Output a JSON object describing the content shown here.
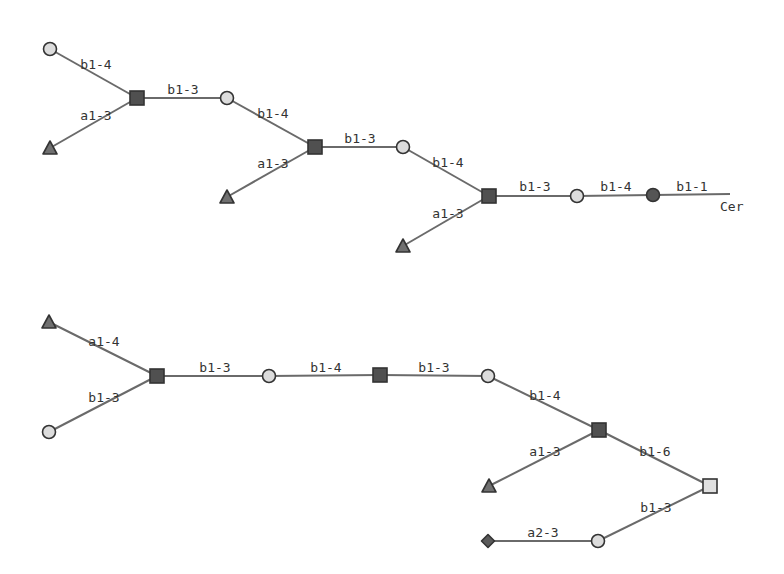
{
  "colors": {
    "background": "#ffffff",
    "edge": "#6a6a6a",
    "label": "#333333",
    "gal_fill": "#dcdcdc",
    "glc_fill": "#555555",
    "glcnac_fill": "#505050",
    "galnac_fill": "#e0e0e0",
    "fuc_fill": "#707070",
    "neuac_fill": "#5a5a5a",
    "stroke": "#333333"
  },
  "diagrams": [
    {
      "id": "top",
      "nodes": [
        {
          "id": "t1",
          "type": "Gal",
          "shape": "circle",
          "fill": "gal_fill",
          "x": 50,
          "y": 49
        },
        {
          "id": "t2",
          "type": "Fuc",
          "shape": "triangle",
          "fill": "fuc_fill",
          "x": 50,
          "y": 148
        },
        {
          "id": "t3",
          "type": "GlcNAc",
          "shape": "square",
          "fill": "glcnac_fill",
          "x": 137,
          "y": 98
        },
        {
          "id": "t4",
          "type": "Gal",
          "shape": "circle",
          "fill": "gal_fill",
          "x": 227,
          "y": 98
        },
        {
          "id": "t5",
          "type": "Fuc",
          "shape": "triangle",
          "fill": "fuc_fill",
          "x": 227,
          "y": 197
        },
        {
          "id": "t6",
          "type": "GlcNAc",
          "shape": "square",
          "fill": "glcnac_fill",
          "x": 315,
          "y": 147
        },
        {
          "id": "t7",
          "type": "Gal",
          "shape": "circle",
          "fill": "gal_fill",
          "x": 403,
          "y": 147
        },
        {
          "id": "t8",
          "type": "Fuc",
          "shape": "triangle",
          "fill": "fuc_fill",
          "x": 403,
          "y": 246
        },
        {
          "id": "t9",
          "type": "GlcNAc",
          "shape": "square",
          "fill": "glcnac_fill",
          "x": 489,
          "y": 196
        },
        {
          "id": "t10",
          "type": "Gal",
          "shape": "circle",
          "fill": "gal_fill",
          "x": 577,
          "y": 196
        },
        {
          "id": "t11",
          "type": "Glc",
          "shape": "circle",
          "fill": "glc_fill",
          "x": 653,
          "y": 195
        }
      ],
      "edges": [
        {
          "from": "t1",
          "to": "t3",
          "label": "b1-4",
          "lx": 96,
          "ly": 69
        },
        {
          "from": "t2",
          "to": "t3",
          "label": "a1-3",
          "lx": 96,
          "ly": 120
        },
        {
          "from": "t3",
          "to": "t4",
          "label": "b1-3",
          "lx": 183,
          "ly": 94
        },
        {
          "from": "t4",
          "to": "t6",
          "label": "b1-4",
          "lx": 273,
          "ly": 118
        },
        {
          "from": "t5",
          "to": "t6",
          "label": "a1-3",
          "lx": 273,
          "ly": 168
        },
        {
          "from": "t6",
          "to": "t7",
          "label": "b1-3",
          "lx": 360,
          "ly": 143
        },
        {
          "from": "t7",
          "to": "t9",
          "label": "b1-4",
          "lx": 448,
          "ly": 167
        },
        {
          "from": "t8",
          "to": "t9",
          "label": "a1-3",
          "lx": 448,
          "ly": 218
        },
        {
          "from": "t9",
          "to": "t10",
          "label": "b1-3",
          "lx": 535,
          "ly": 191
        },
        {
          "from": "t10",
          "to": "t11",
          "label": "b1-4",
          "lx": 616,
          "ly": 191
        },
        {
          "from": "t11",
          "to": "aglycone",
          "label": "b1-1",
          "lx": 692,
          "ly": 191
        }
      ],
      "aglycone": {
        "label": "Cer",
        "x": 730,
        "y": 194,
        "lx": 720,
        "ly": 211
      }
    },
    {
      "id": "bottom",
      "nodes": [
        {
          "id": "b1",
          "type": "Fuc",
          "shape": "triangle",
          "fill": "fuc_fill",
          "x": 49,
          "y": 322
        },
        {
          "id": "b2",
          "type": "Gal",
          "shape": "circle",
          "fill": "gal_fill",
          "x": 49,
          "y": 432
        },
        {
          "id": "b3",
          "type": "GlcNAc",
          "shape": "square",
          "fill": "glcnac_fill",
          "x": 157,
          "y": 376
        },
        {
          "id": "b4",
          "type": "Gal",
          "shape": "circle",
          "fill": "gal_fill",
          "x": 269,
          "y": 376
        },
        {
          "id": "b5",
          "type": "GlcNAc",
          "shape": "square",
          "fill": "glcnac_fill",
          "x": 380,
          "y": 375
        },
        {
          "id": "b6",
          "type": "Gal",
          "shape": "circle",
          "fill": "gal_fill",
          "x": 488,
          "y": 376
        },
        {
          "id": "b7",
          "type": "GlcNAc",
          "shape": "square",
          "fill": "glcnac_fill",
          "x": 599,
          "y": 430
        },
        {
          "id": "b8",
          "type": "Fuc",
          "shape": "triangle",
          "fill": "fuc_fill",
          "x": 489,
          "y": 486
        },
        {
          "id": "b9",
          "type": "GalNAc",
          "shape": "square",
          "fill": "galnac_fill",
          "x": 710,
          "y": 486
        },
        {
          "id": "b10",
          "type": "Gal",
          "shape": "circle",
          "fill": "gal_fill",
          "x": 598,
          "y": 541
        },
        {
          "id": "b11",
          "type": "NeuAc",
          "shape": "diamond",
          "fill": "neuac_fill",
          "x": 488,
          "y": 541
        }
      ],
      "edges": [
        {
          "from": "b1",
          "to": "b3",
          "label": "a1-4",
          "lx": 104,
          "ly": 346
        },
        {
          "from": "b2",
          "to": "b3",
          "label": "b1-3",
          "lx": 104,
          "ly": 402
        },
        {
          "from": "b3",
          "to": "b4",
          "label": "b1-3",
          "lx": 215,
          "ly": 372
        },
        {
          "from": "b4",
          "to": "b5",
          "label": "b1-4",
          "lx": 326,
          "ly": 372
        },
        {
          "from": "b5",
          "to": "b6",
          "label": "b1-3",
          "lx": 434,
          "ly": 372
        },
        {
          "from": "b6",
          "to": "b7",
          "label": "b1-4",
          "lx": 545,
          "ly": 400
        },
        {
          "from": "b8",
          "to": "b7",
          "label": "a1-3",
          "lx": 545,
          "ly": 456
        },
        {
          "from": "b7",
          "to": "b9",
          "label": "b1-6",
          "lx": 655,
          "ly": 456
        },
        {
          "from": "b10",
          "to": "b9",
          "label": "b1-3",
          "lx": 656,
          "ly": 512
        },
        {
          "from": "b11",
          "to": "b10",
          "label": "a2-3",
          "lx": 543,
          "ly": 537
        }
      ]
    }
  ]
}
